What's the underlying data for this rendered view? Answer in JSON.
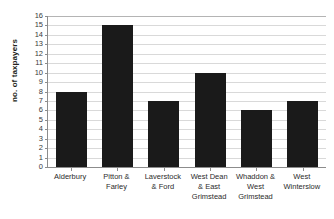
{
  "chart_data": {
    "type": "bar",
    "title": "",
    "subtitle": "",
    "xlabel": "",
    "ylabel": "no. of taxpayers",
    "categories": [
      "Alderbury",
      "Pitton & Farley",
      "Laverstock & Ford",
      "West Dean & East Grimstead",
      "Whaddon & West Grimstead",
      "West Winterslow"
    ],
    "category_lines": [
      [
        "Alderbury"
      ],
      [
        "Pitton &",
        "Farley"
      ],
      [
        "Laverstock",
        "& Ford"
      ],
      [
        "West Dean",
        "& East",
        "Grimstead"
      ],
      [
        "Whaddon &",
        "West",
        "Grimstead"
      ],
      [
        "West",
        "Winterslow"
      ]
    ],
    "values": [
      8,
      15,
      7,
      10,
      6,
      7
    ],
    "ylim": [
      0,
      16
    ],
    "ytick_step": 1,
    "yticks": [
      16,
      15,
      14,
      13,
      12,
      11,
      10,
      9,
      8,
      7,
      6,
      5,
      4,
      3,
      2,
      1,
      0
    ],
    "grid": true,
    "grid_axis": "y",
    "legend": false,
    "legend_position": "none",
    "bar_color": "#1a1a1a",
    "grid_color": "#d9d9d9",
    "axis_color": "#8c8c8c",
    "background_color": "#ffffff"
  }
}
